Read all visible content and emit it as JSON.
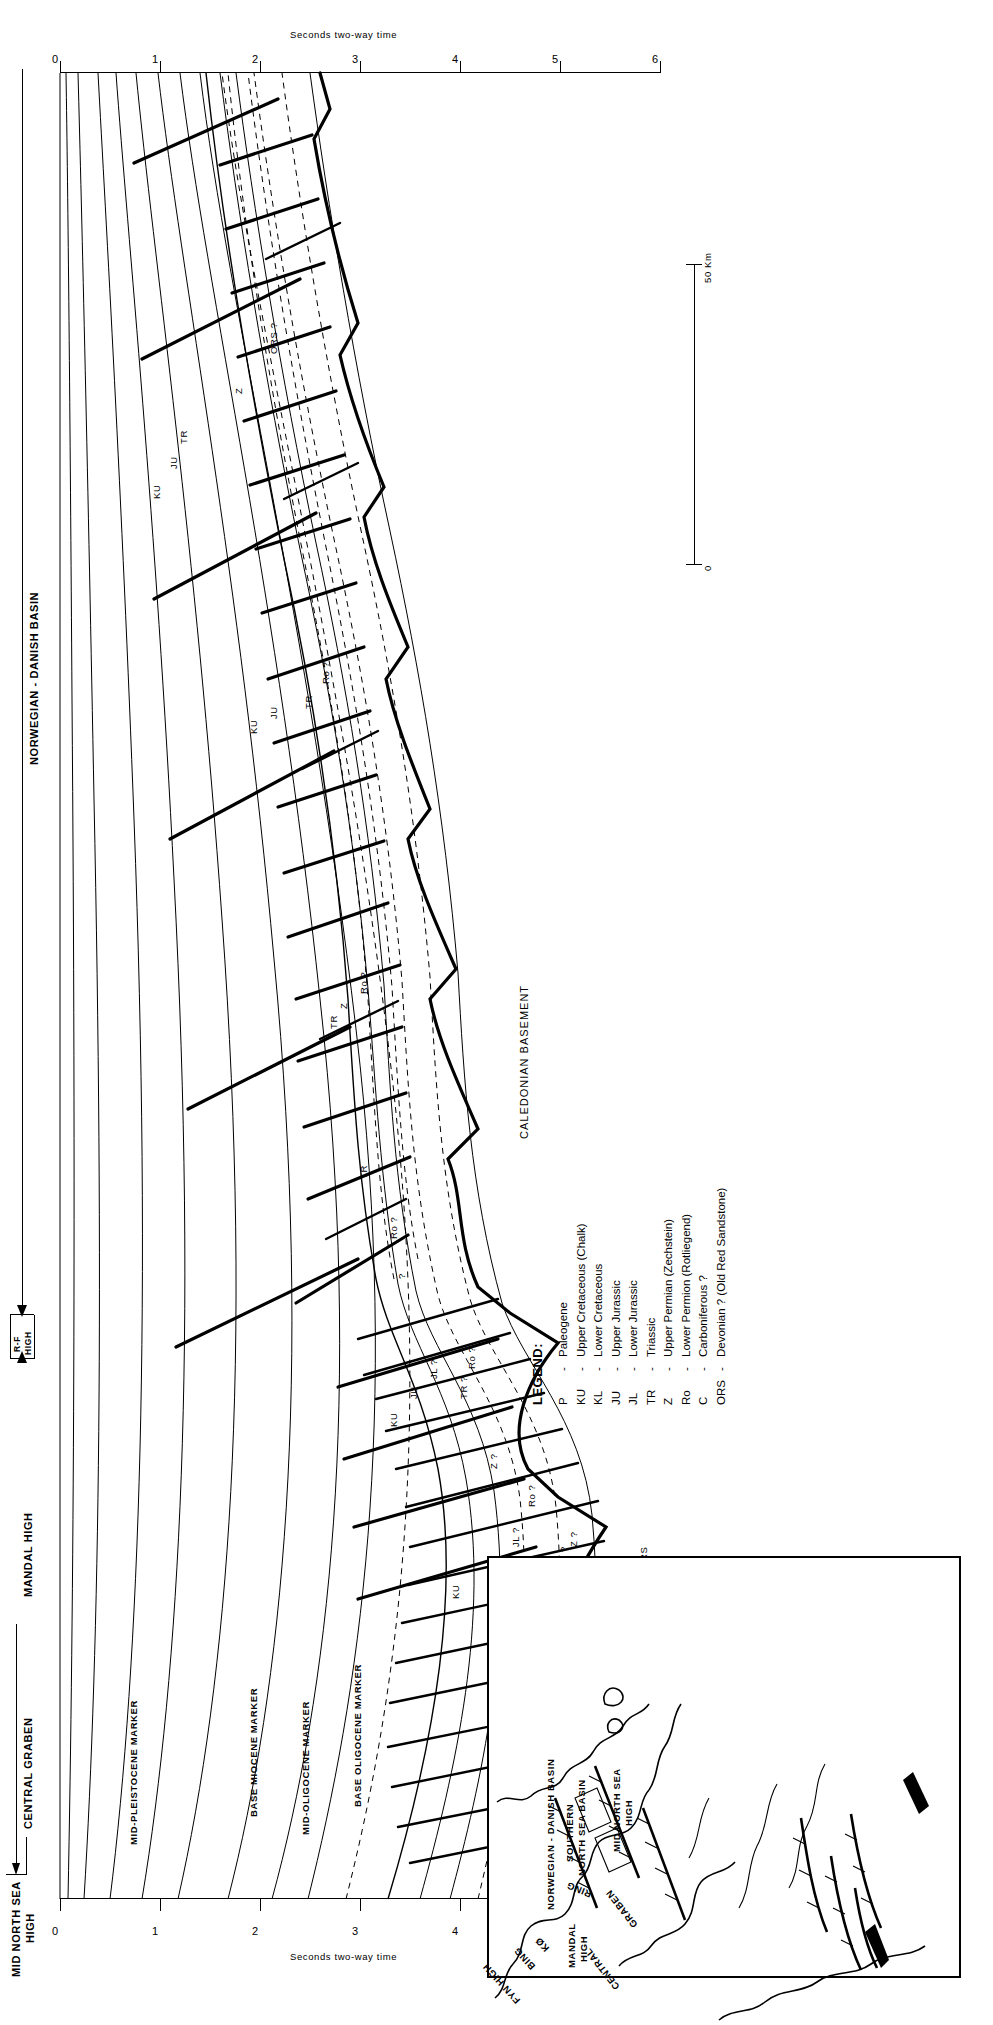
{
  "figure": {
    "type": "geological-seismic-cross-section",
    "orientation_note": "whole figure rotated 90 degrees",
    "axis": {
      "label": "Seconds two-way time",
      "ticks": [
        "0",
        "1",
        "2",
        "3",
        "4",
        "5",
        "6"
      ],
      "min": 0,
      "max": 6
    },
    "scalebar": {
      "label": "50 Km",
      "zero": "0"
    }
  },
  "headers": {
    "left_high": "MID NORTH SEA\nHIGH",
    "left_high_line1": "MID NORTH SEA",
    "left_high_line2": "HIGH",
    "central_graben": "CENTRAL GRABEN",
    "mandal_high": "MANDAL HIGH",
    "rf_high_line1": "R-F",
    "rf_high_line2": "HIGH",
    "basin": "NORWEGIAN - DANISH BASIN"
  },
  "markers": [
    "MID-PLEISTOCENE MARKER",
    "BASE MIOCENE MARKER",
    "MID-OLIGOCENE MARKER",
    "BASE OLIGOCENE MARKER"
  ],
  "basement_label": "CALEDONIAN BASEMENT",
  "unit_labels": [
    {
      "text": "P",
      "x": 262,
      "y": 470
    },
    {
      "text": "KU",
      "x": 300,
      "y": 392
    },
    {
      "text": "KL",
      "x": 300,
      "y": 447
    },
    {
      "text": "JU",
      "x": 330,
      "y": 432
    },
    {
      "text": "JL ?",
      "x": 352,
      "y": 452
    },
    {
      "text": "TR ?",
      "x": 330,
      "y": 500
    },
    {
      "text": "Z ?",
      "x": 352,
      "y": 510
    },
    {
      "text": "C ?",
      "x": 300,
      "y": 560
    },
    {
      "text": "ORS",
      "x": 330,
      "y": 580
    },
    {
      "text": "Ro ?",
      "x": 392,
      "y": 468
    },
    {
      "text": "Z ?",
      "x": 430,
      "y": 430
    },
    {
      "text": "KU",
      "x": 472,
      "y": 330
    },
    {
      "text": "JU",
      "x": 500,
      "y": 350
    },
    {
      "text": "JL ?",
      "x": 520,
      "y": 370
    },
    {
      "text": "TR ?",
      "x": 500,
      "y": 400
    },
    {
      "text": "Ro ?",
      "x": 530,
      "y": 408
    },
    {
      "text": "?",
      "x": 620,
      "y": 338
    },
    {
      "text": "Ro ?",
      "x": 660,
      "y": 330
    },
    {
      "text": "TR",
      "x": 720,
      "y": 300
    },
    {
      "text": "TR",
      "x": 870,
      "y": 270
    },
    {
      "text": "Z",
      "x": 890,
      "y": 280
    },
    {
      "text": "Ro ?",
      "x": 905,
      "y": 300
    },
    {
      "text": "TR",
      "x": 1190,
      "y": 245
    },
    {
      "text": "KU",
      "x": 1165,
      "y": 190
    },
    {
      "text": "JU",
      "x": 1180,
      "y": 210
    },
    {
      "text": "Ro ?",
      "x": 1215,
      "y": 262
    },
    {
      "text": "ORS ?",
      "x": 1545,
      "y": 210
    },
    {
      "text": "Z",
      "x": 1505,
      "y": 175
    },
    {
      "text": "TR",
      "x": 1455,
      "y": 120
    },
    {
      "text": "KU",
      "x": 1400,
      "y": 93
    },
    {
      "text": "JU",
      "x": 1430,
      "y": 110
    }
  ],
  "legend": {
    "title": "LEGEND:",
    "entries": [
      {
        "code": "P",
        "dash": "-",
        "desc": "Paleogene"
      },
      {
        "code": "KU",
        "dash": "-",
        "desc": "Upper Cretaceous (Chalk)"
      },
      {
        "code": "KL",
        "dash": "-",
        "desc": "Lower Cretaceous"
      },
      {
        "code": "JU",
        "dash": "-",
        "desc": "Upper Jurassic"
      },
      {
        "code": "JL",
        "dash": "-",
        "desc": "Lower Jurassic"
      },
      {
        "code": "TR",
        "dash": "-",
        "desc": "Triassic"
      },
      {
        "code": "Z",
        "dash": "-",
        "desc": "Upper Permian (Zechstein)"
      },
      {
        "code": "Ro",
        "dash": "-",
        "desc": "Lower Permion (Rotliegend)"
      },
      {
        "code": "C",
        "dash": "-",
        "desc": "Carboniferous ?"
      },
      {
        "code": "ORS",
        "dash": "-",
        "desc": "Devonian ? (Old Red Sandstone)"
      }
    ]
  },
  "inset_map": {
    "labels": [
      {
        "text": "NORWEGIAN - DANISH BASIN",
        "x": 118,
        "y": 56,
        "rot": 0,
        "size": 9.5
      },
      {
        "text": "MANDAL",
        "x": 60,
        "y": 77,
        "rot": 0,
        "size": 9.5
      },
      {
        "text": "HIGH",
        "x": 66,
        "y": 89,
        "rot": 0,
        "size": 9.5
      },
      {
        "text": "CENTRAL",
        "x": 36,
        "y": 124,
        "rot": -38,
        "size": 9.5
      },
      {
        "text": "GRABEN",
        "x": 98,
        "y": 142,
        "rot": -38,
        "size": 9.5
      },
      {
        "text": "MID NORTH SEA",
        "x": 176,
        "y": 122,
        "rot": 0,
        "size": 9.5
      },
      {
        "text": "HIGH",
        "x": 202,
        "y": 134,
        "rot": 0,
        "size": 9.5
      },
      {
        "text": "SOUTHERN",
        "x": 166,
        "y": 75,
        "rot": 0,
        "size": 9.5
      },
      {
        "text": "NORTH SEA BASIN",
        "x": 152,
        "y": 87,
        "rot": 0,
        "size": 9.5
      },
      {
        "text": "RING",
        "x": 128,
        "y": 100,
        "rot": -68,
        "size": 9.5
      },
      {
        "text": "KØ",
        "x": 74,
        "y": 54,
        "rot": -42,
        "size": 9.5
      },
      {
        "text": "BING",
        "x": 56,
        "y": 40,
        "rot": -42,
        "size": 9.5
      },
      {
        "text": "FYN HIGH",
        "x": 22,
        "y": 25,
        "rot": -42,
        "size": 9.5
      }
    ]
  }
}
